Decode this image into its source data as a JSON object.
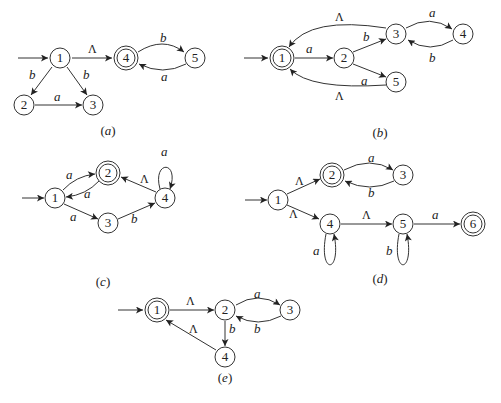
{
  "figure": {
    "colors": {
      "stroke": "#333333",
      "text": "#222222",
      "background": "#ffffff"
    },
    "lambda_symbol": "Λ"
  },
  "diagrams": [
    {
      "id": "a",
      "caption": "(a)",
      "caption_letter": "a",
      "start_state": "1",
      "accepting_states": [
        "4"
      ],
      "nodes": [
        {
          "id": "1",
          "label": "1",
          "x": 60,
          "y": 58,
          "accepting": false
        },
        {
          "id": "2",
          "label": "2",
          "x": 24,
          "y": 105,
          "accepting": false
        },
        {
          "id": "3",
          "label": "3",
          "x": 93,
          "y": 105,
          "accepting": false
        },
        {
          "id": "4",
          "label": "4",
          "x": 126,
          "y": 58,
          "accepting": true
        },
        {
          "id": "5",
          "label": "5",
          "x": 195,
          "y": 58,
          "accepting": false
        }
      ],
      "edges": [
        {
          "from": "1",
          "to": "4",
          "label": "Λ"
        },
        {
          "from": "1",
          "to": "2",
          "label": "b"
        },
        {
          "from": "1",
          "to": "3",
          "label": "b"
        },
        {
          "from": "2",
          "to": "3",
          "label": "a"
        },
        {
          "from": "4",
          "to": "5",
          "label": "b"
        },
        {
          "from": "5",
          "to": "4",
          "label": "a"
        }
      ]
    },
    {
      "id": "b",
      "caption": "(b)",
      "caption_letter": "b",
      "start_state": "1",
      "accepting_states": [
        "1"
      ],
      "nodes": [
        {
          "id": "1",
          "label": "1",
          "x": 282,
          "y": 58,
          "accepting": true
        },
        {
          "id": "2",
          "label": "2",
          "x": 344,
          "y": 58,
          "accepting": false
        },
        {
          "id": "3",
          "label": "3",
          "x": 396,
          "y": 34,
          "accepting": false
        },
        {
          "id": "4",
          "label": "4",
          "x": 463,
          "y": 34,
          "accepting": false
        },
        {
          "id": "5",
          "label": "5",
          "x": 396,
          "y": 82,
          "accepting": false
        }
      ],
      "edges": [
        {
          "from": "1",
          "to": "2",
          "label": "a"
        },
        {
          "from": "2",
          "to": "3",
          "label": "b"
        },
        {
          "from": "2",
          "to": "5",
          "label": "a"
        },
        {
          "from": "3",
          "to": "4",
          "label": "a"
        },
        {
          "from": "4",
          "to": "3",
          "label": "b"
        },
        {
          "from": "3",
          "to": "1",
          "label": "Λ"
        },
        {
          "from": "5",
          "to": "1",
          "label": "Λ"
        }
      ]
    },
    {
      "id": "c",
      "caption": "(c)",
      "caption_letter": "c",
      "start_state": "1",
      "accepting_states": [
        "2"
      ],
      "nodes": [
        {
          "id": "1",
          "label": "1",
          "x": 55,
          "y": 198,
          "accepting": false
        },
        {
          "id": "2",
          "label": "2",
          "x": 108,
          "y": 173,
          "accepting": true
        },
        {
          "id": "3",
          "label": "3",
          "x": 108,
          "y": 223,
          "accepting": false
        },
        {
          "id": "4",
          "label": "4",
          "x": 165,
          "y": 198,
          "accepting": false
        }
      ],
      "edges": [
        {
          "from": "1",
          "to": "2",
          "label": "a"
        },
        {
          "from": "2",
          "to": "1",
          "label": "a"
        },
        {
          "from": "1",
          "to": "3",
          "label": "a"
        },
        {
          "from": "3",
          "to": "4",
          "label": "b"
        },
        {
          "from": "4",
          "to": "2",
          "label": "Λ"
        },
        {
          "from": "4",
          "to": "4",
          "label": "a"
        }
      ]
    },
    {
      "id": "d",
      "caption": "(d)",
      "caption_letter": "d",
      "start_state": "1",
      "accepting_states": [
        "2",
        "6"
      ],
      "nodes": [
        {
          "id": "1",
          "label": "1",
          "x": 278,
          "y": 200,
          "accepting": false
        },
        {
          "id": "2",
          "label": "2",
          "x": 332,
          "y": 175,
          "accepting": true
        },
        {
          "id": "3",
          "label": "3",
          "x": 403,
          "y": 175,
          "accepting": false
        },
        {
          "id": "4",
          "label": "4",
          "x": 330,
          "y": 224,
          "accepting": false
        },
        {
          "id": "5",
          "label": "5",
          "x": 403,
          "y": 224,
          "accepting": false
        },
        {
          "id": "6",
          "label": "6",
          "x": 473,
          "y": 224,
          "accepting": true
        }
      ],
      "edges": [
        {
          "from": "1",
          "to": "2",
          "label": "Λ"
        },
        {
          "from": "1",
          "to": "4",
          "label": "Λ"
        },
        {
          "from": "2",
          "to": "3",
          "label": "a"
        },
        {
          "from": "3",
          "to": "2",
          "label": "b"
        },
        {
          "from": "4",
          "to": "5",
          "label": "Λ"
        },
        {
          "from": "4",
          "to": "4",
          "label": "a"
        },
        {
          "from": "5",
          "to": "5",
          "label": "b"
        },
        {
          "from": "5",
          "to": "6",
          "label": "a"
        }
      ]
    },
    {
      "id": "e",
      "caption": "(e)",
      "caption_letter": "e",
      "start_state": "1",
      "accepting_states": [
        "1"
      ],
      "nodes": [
        {
          "id": "1",
          "label": "1",
          "x": 157,
          "y": 310,
          "accepting": true
        },
        {
          "id": "2",
          "label": "2",
          "x": 225,
          "y": 310,
          "accepting": false
        },
        {
          "id": "3",
          "label": "3",
          "x": 290,
          "y": 310,
          "accepting": false
        },
        {
          "id": "4",
          "label": "4",
          "x": 225,
          "y": 357,
          "accepting": false
        }
      ],
      "edges": [
        {
          "from": "1",
          "to": "2",
          "label": "Λ"
        },
        {
          "from": "2",
          "to": "3",
          "label": "a"
        },
        {
          "from": "3",
          "to": "2",
          "label": "b"
        },
        {
          "from": "2",
          "to": "4",
          "label": "b"
        },
        {
          "from": "4",
          "to": "1",
          "label": "Λ"
        }
      ]
    }
  ]
}
